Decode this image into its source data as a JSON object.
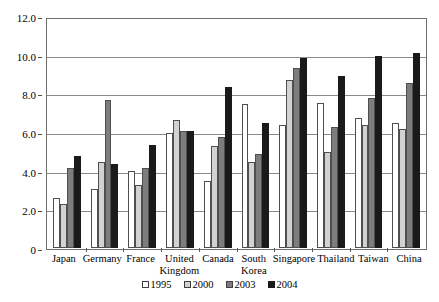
{
  "chart_data": {
    "type": "bar",
    "title": "",
    "xlabel": "",
    "ylabel": "",
    "ylim": [
      0,
      12
    ],
    "ytick_labels": [
      "12.0",
      "10.0",
      "8.0",
      "6.0",
      "4.0",
      "2.0",
      "0"
    ],
    "ytick_values": [
      12,
      10,
      8,
      6,
      4,
      2,
      0
    ],
    "grid": true,
    "legend_position": "bottom",
    "categories": [
      "Japan",
      "Germany",
      "France",
      "United Kingdom",
      "Canada",
      "South Korea",
      "Singapore",
      "Thailand",
      "Taiwan",
      "China"
    ],
    "series": [
      {
        "name": "1995",
        "color": "#ffffff",
        "values": [
          2.6,
          3.1,
          4.0,
          6.0,
          3.5,
          7.5,
          6.4,
          7.55,
          6.8,
          6.5
        ]
      },
      {
        "name": "2000",
        "color": "#d2d2d2",
        "values": [
          2.3,
          4.5,
          3.3,
          6.7,
          5.3,
          4.5,
          8.75,
          5.0,
          6.4,
          6.2
        ]
      },
      {
        "name": "2003",
        "color": "#7d7d7d",
        "values": [
          4.2,
          7.7,
          4.2,
          6.1,
          5.8,
          4.9,
          9.4,
          6.3,
          7.85,
          8.6
        ]
      },
      {
        "name": "2004",
        "color": "#1a1a1a",
        "values": [
          4.8,
          4.4,
          5.4,
          6.1,
          8.4,
          6.5,
          9.9,
          9.0,
          10.0,
          10.2
        ]
      }
    ]
  }
}
